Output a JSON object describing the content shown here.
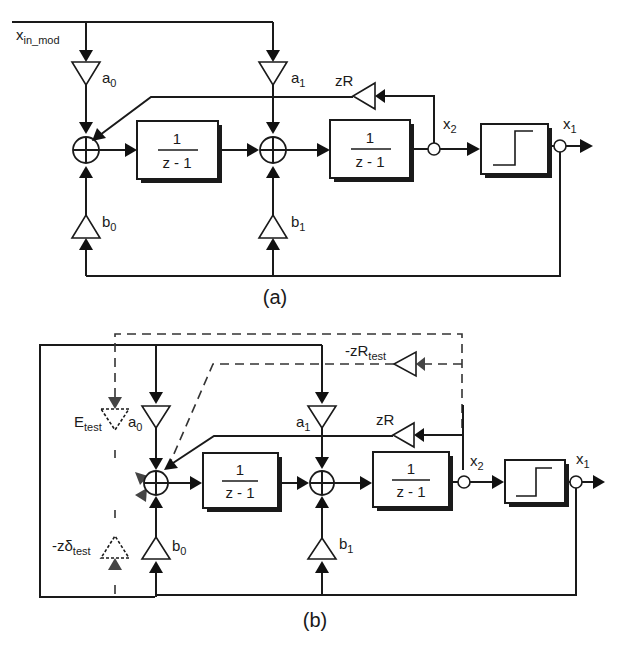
{
  "figure": {
    "panel_a": {
      "caption": "(a)",
      "input_label": "x",
      "input_sub": "in_mod",
      "gains": {
        "a0": {
          "main": "a",
          "sub": "0"
        },
        "a1": {
          "main": "a",
          "sub": "1"
        },
        "b0": {
          "main": "b",
          "sub": "0"
        },
        "b1": {
          "main": "b",
          "sub": "1"
        },
        "zR": {
          "main": "zR",
          "sub": ""
        }
      },
      "integrators": [
        {
          "num": "1",
          "den": "z - 1"
        },
        {
          "num": "1",
          "den": "z - 1"
        }
      ],
      "nodes": {
        "x2": {
          "main": "x",
          "sub": "2"
        },
        "x1": {
          "main": "x",
          "sub": "1"
        }
      },
      "quantizer": "step-function"
    },
    "panel_b": {
      "caption": "(b)",
      "gains": {
        "a0": {
          "main": "a",
          "sub": "0"
        },
        "a1": {
          "main": "a",
          "sub": "1"
        },
        "b0": {
          "main": "b",
          "sub": "0"
        },
        "b1": {
          "main": "b",
          "sub": "1"
        },
        "zR": {
          "main": "zR",
          "sub": ""
        },
        "zRtest": {
          "main": "-zR",
          "sub": "test"
        },
        "Etest": {
          "main": "E",
          "sub": "test"
        },
        "zdtest": {
          "main": "-zδ",
          "sub": "test"
        }
      },
      "integrators": [
        {
          "num": "1",
          "den": "z - 1"
        },
        {
          "num": "1",
          "den": "z - 1"
        }
      ],
      "nodes": {
        "x2": {
          "main": "x",
          "sub": "2"
        },
        "x1": {
          "main": "x",
          "sub": "1"
        }
      },
      "quantizer": "step-function"
    }
  }
}
